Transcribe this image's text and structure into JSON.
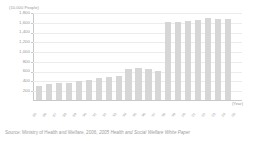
{
  "chart_data": {
    "type": "bar",
    "title": "",
    "subtitle": "",
    "ylabel": "(10,000 People)",
    "xlabel": "(Year)",
    "ylim": [
      0,
      1800
    ],
    "ytick_labels": [
      "1,800",
      "1,600",
      "1,400",
      "1,200",
      "1,000",
      "800",
      "600",
      "400",
      "200"
    ],
    "ytick_values": [
      1800,
      1600,
      1400,
      1200,
      1000,
      800,
      600,
      400,
      200
    ],
    "grid": true,
    "legend": "none",
    "bar_color": "#d6d6d6",
    "categories": [
      "'85",
      "'86",
      "'87",
      "'88",
      "'89",
      "'90",
      "'91",
      "'92",
      "'93",
      "'94",
      "'95",
      "'96",
      "'97",
      "'98",
      "'99",
      "'00",
      "'01",
      "'02",
      "'03",
      "'04",
      "'05"
    ],
    "values": [
      300,
      330,
      350,
      360,
      390,
      420,
      450,
      470,
      500,
      640,
      660,
      650,
      600,
      1610,
      1620,
      1630,
      1650,
      1700,
      1670,
      1670,
      0
    ]
  },
  "source": {
    "prefix": "Source:  Ministry of Health and Welfare, 2006,",
    "italic": "2005 Health and Social Welfare White Paper"
  }
}
